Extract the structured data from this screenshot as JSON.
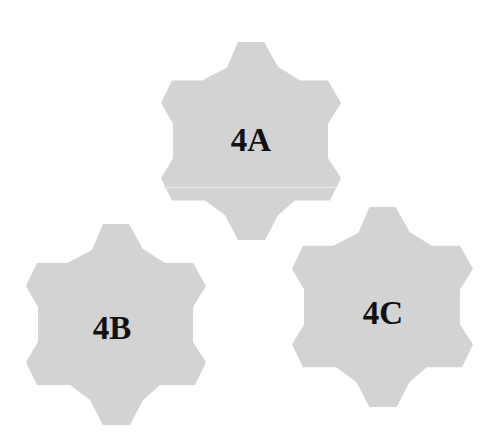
{
  "canvas": {
    "width": 495,
    "height": 442,
    "background": "#ffffff"
  },
  "style": {
    "fill": "#d3d3d3",
    "label_color": "#111111"
  },
  "gears": [
    {
      "id": "4A",
      "label": "4A",
      "box": {
        "x": 161,
        "y": 42,
        "w": 180,
        "h": 198
      },
      "label_center": {
        "x": 251,
        "y": 140
      }
    },
    {
      "id": "4B",
      "label": "4B",
      "box": {
        "x": 26,
        "y": 224,
        "w": 180,
        "h": 201
      },
      "label_center": {
        "x": 112,
        "y": 328
      }
    },
    {
      "id": "4C",
      "label": "4C",
      "box": {
        "x": 292,
        "y": 207,
        "w": 181,
        "h": 200
      },
      "label_center": {
        "x": 383,
        "y": 313
      }
    }
  ]
}
